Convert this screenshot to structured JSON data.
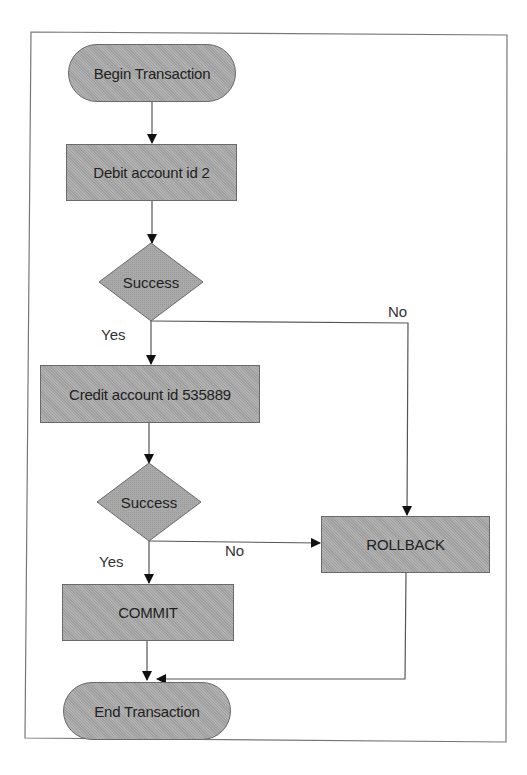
{
  "diagram": {
    "title": "",
    "type": "flowchart",
    "nodes": {
      "begin": {
        "label": "Begin Transaction",
        "shape": "terminator"
      },
      "debit": {
        "label": "Debit account id 2",
        "shape": "process"
      },
      "decision1": {
        "label": "Success",
        "shape": "decision"
      },
      "credit": {
        "label": "Credit account id 535889",
        "shape": "process"
      },
      "decision2": {
        "label": "Success",
        "shape": "decision"
      },
      "rollback": {
        "label": "ROLLBACK",
        "shape": "process"
      },
      "commit": {
        "label": "COMMIT",
        "shape": "process"
      },
      "end": {
        "label": "End Transaction",
        "shape": "terminator"
      }
    },
    "edges": {
      "d1_yes": {
        "label": "Yes"
      },
      "d1_no": {
        "label": "No"
      },
      "d2_yes": {
        "label": "Yes"
      },
      "d2_no": {
        "label": "No"
      }
    },
    "colors": {
      "node_fill": "#a9a9a9",
      "node_border": "#6a6a6a",
      "line": "#555555",
      "frame": "#777777",
      "text": "#222222"
    }
  }
}
